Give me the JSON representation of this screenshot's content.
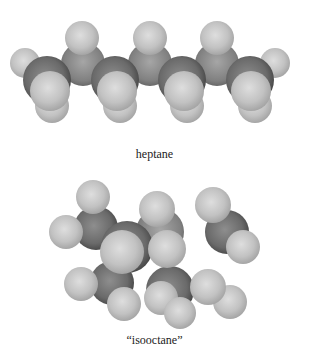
{
  "figure": {
    "molecules": [
      {
        "name": "heptane",
        "label": "heptane",
        "label_y": 147,
        "atoms": [
          {
            "el": "H",
            "x": 25,
            "y": 63,
            "r": 15
          },
          {
            "el": "H",
            "x": 275,
            "y": 63,
            "r": 15
          },
          {
            "el": "H",
            "x": 52,
            "y": 106,
            "r": 17
          },
          {
            "el": "H",
            "x": 120,
            "y": 106,
            "r": 17
          },
          {
            "el": "H",
            "x": 187,
            "y": 106,
            "r": 17
          },
          {
            "el": "H",
            "x": 255,
            "y": 106,
            "r": 17
          },
          {
            "el": "C",
            "x": 83,
            "y": 64,
            "r": 22,
            "tone": "mid"
          },
          {
            "el": "C",
            "x": 150,
            "y": 64,
            "r": 22,
            "tone": "mid"
          },
          {
            "el": "C",
            "x": 217,
            "y": 64,
            "r": 22,
            "tone": "mid"
          },
          {
            "el": "H",
            "x": 82,
            "y": 38,
            "r": 17
          },
          {
            "el": "H",
            "x": 150,
            "y": 38,
            "r": 17
          },
          {
            "el": "H",
            "x": 217,
            "y": 38,
            "r": 17
          },
          {
            "el": "C",
            "x": 47,
            "y": 80,
            "r": 24,
            "tone": "dark"
          },
          {
            "el": "C",
            "x": 115,
            "y": 80,
            "r": 24,
            "tone": "dark"
          },
          {
            "el": "C",
            "x": 182,
            "y": 80,
            "r": 24,
            "tone": "dark"
          },
          {
            "el": "C",
            "x": 250,
            "y": 80,
            "r": 24,
            "tone": "dark"
          },
          {
            "el": "H",
            "x": 50,
            "y": 91,
            "r": 20
          },
          {
            "el": "H",
            "x": 117,
            "y": 91,
            "r": 20
          },
          {
            "el": "H",
            "x": 184,
            "y": 91,
            "r": 20
          },
          {
            "el": "H",
            "x": 251,
            "y": 91,
            "r": 20
          }
        ]
      },
      {
        "name": "isooctane",
        "label": "“isooctane”",
        "label_y": 340,
        "atoms": [
          {
            "el": "C",
            "x": 227,
            "y": 232,
            "r": 22,
            "tone": "dark"
          },
          {
            "el": "C",
            "x": 96,
            "y": 228,
            "r": 22,
            "tone": "dark"
          },
          {
            "el": "H",
            "x": 93,
            "y": 197,
            "r": 17
          },
          {
            "el": "H",
            "x": 213,
            "y": 205,
            "r": 18
          },
          {
            "el": "H",
            "x": 66,
            "y": 232,
            "r": 17
          },
          {
            "el": "H",
            "x": 243,
            "y": 247,
            "r": 17
          },
          {
            "el": "C",
            "x": 160,
            "y": 232,
            "r": 24,
            "tone": "mid"
          },
          {
            "el": "H",
            "x": 157,
            "y": 209,
            "r": 18
          },
          {
            "el": "C",
            "x": 112,
            "y": 283,
            "r": 22,
            "tone": "dark"
          },
          {
            "el": "C",
            "x": 170,
            "y": 290,
            "r": 24,
            "tone": "dark"
          },
          {
            "el": "H",
            "x": 81,
            "y": 284,
            "r": 17
          },
          {
            "el": "H",
            "x": 161,
            "y": 298,
            "r": 17
          },
          {
            "el": "H",
            "x": 180,
            "y": 313,
            "r": 16
          },
          {
            "el": "H",
            "x": 230,
            "y": 302,
            "r": 17
          },
          {
            "el": "H",
            "x": 208,
            "y": 287,
            "r": 18
          },
          {
            "el": "H",
            "x": 124,
            "y": 304,
            "r": 17
          },
          {
            "el": "C",
            "x": 127,
            "y": 247,
            "r": 26,
            "tone": "dark"
          },
          {
            "el": "H",
            "x": 122,
            "y": 252,
            "r": 22
          },
          {
            "el": "H",
            "x": 167,
            "y": 249,
            "r": 19
          }
        ]
      }
    ]
  },
  "colors": {
    "background": "#ffffff",
    "h_light": "#dcdcdc",
    "h_mid": "#b5b5b5",
    "h_dark": "#8f8f8f",
    "c_mid_light": "#a8a8a8",
    "c_mid_dark": "#5e5e5e",
    "c_dark_light": "#8a8a8a",
    "c_dark_dark": "#3f3f3f",
    "label": "#222222"
  }
}
